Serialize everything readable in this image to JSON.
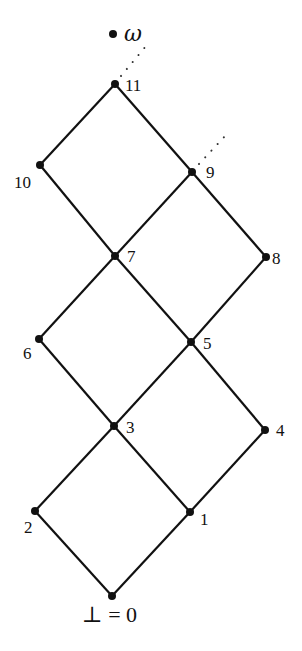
{
  "diagram": {
    "type": "lattice-hasse-diagram",
    "top_label": "ω",
    "bottom_label": "⊥ = 0",
    "nodes": [
      {
        "id": "omega",
        "label": "",
        "x": 113,
        "y": 34
      },
      {
        "id": "11",
        "label": "11",
        "x": 115,
        "y": 84
      },
      {
        "id": "10",
        "label": "10",
        "x": 40,
        "y": 165
      },
      {
        "id": "9",
        "label": "9",
        "x": 192,
        "y": 172
      },
      {
        "id": "7",
        "label": "7",
        "x": 115,
        "y": 256
      },
      {
        "id": "8",
        "label": "8",
        "x": 266,
        "y": 257
      },
      {
        "id": "6",
        "label": "6",
        "x": 39,
        "y": 339
      },
      {
        "id": "5",
        "label": "5",
        "x": 191,
        "y": 342
      },
      {
        "id": "3",
        "label": "3",
        "x": 114,
        "y": 426
      },
      {
        "id": "4",
        "label": "4",
        "x": 265,
        "y": 430
      },
      {
        "id": "2",
        "label": "2",
        "x": 35,
        "y": 511
      },
      {
        "id": "1",
        "label": "1",
        "x": 190,
        "y": 512
      },
      {
        "id": "0",
        "label": "",
        "x": 112,
        "y": 596
      }
    ],
    "edges": [
      [
        "0",
        "2"
      ],
      [
        "0",
        "1"
      ],
      [
        "2",
        "3"
      ],
      [
        "1",
        "3"
      ],
      [
        "1",
        "4"
      ],
      [
        "3",
        "6"
      ],
      [
        "3",
        "5"
      ],
      [
        "4",
        "5"
      ],
      [
        "6",
        "7"
      ],
      [
        "5",
        "7"
      ],
      [
        "5",
        "8"
      ],
      [
        "7",
        "10"
      ],
      [
        "7",
        "9"
      ],
      [
        "8",
        "9"
      ],
      [
        "10",
        "11"
      ],
      [
        "9",
        "11"
      ]
    ],
    "dotted_continuations": [
      {
        "from": "11",
        "toward": "omega"
      },
      {
        "from": "9",
        "toward": "upper-right"
      }
    ]
  }
}
